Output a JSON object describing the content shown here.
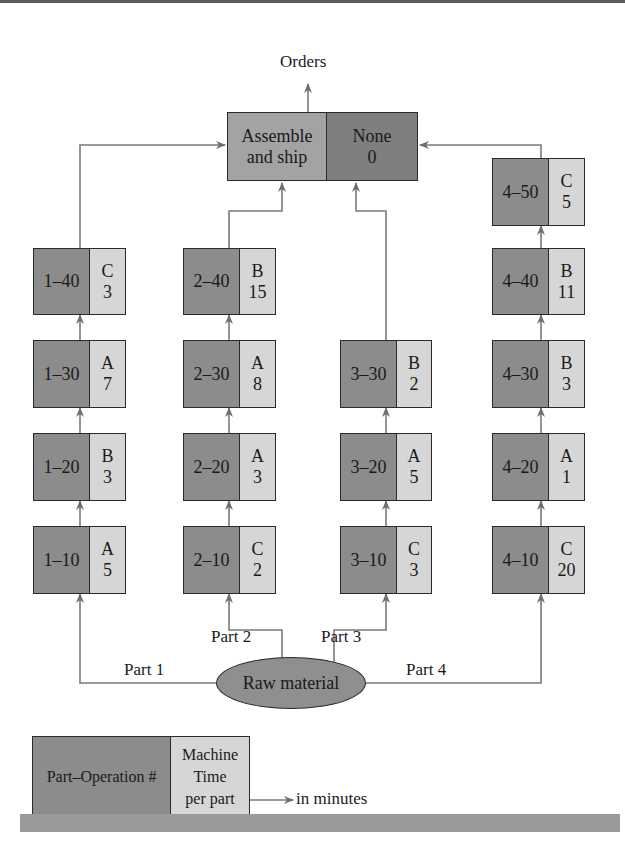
{
  "diagram": {
    "output_label": "Orders",
    "assembly": {
      "operation_line1": "Assemble",
      "operation_line2": "and ship",
      "machine": "None",
      "time": "0"
    },
    "source": {
      "label": "Raw material"
    },
    "parts": [
      {
        "label": "Part 1",
        "operations": [
          {
            "id": "1–10",
            "machine": "A",
            "time": "5"
          },
          {
            "id": "1–20",
            "machine": "B",
            "time": "3"
          },
          {
            "id": "1–30",
            "machine": "A",
            "time": "7"
          },
          {
            "id": "1–40",
            "machine": "C",
            "time": "3"
          }
        ]
      },
      {
        "label": "Part 2",
        "operations": [
          {
            "id": "2–10",
            "machine": "C",
            "time": "2"
          },
          {
            "id": "2–20",
            "machine": "A",
            "time": "3"
          },
          {
            "id": "2–30",
            "machine": "A",
            "time": "8"
          },
          {
            "id": "2–40",
            "machine": "B",
            "time": "15"
          }
        ]
      },
      {
        "label": "Part 3",
        "operations": [
          {
            "id": "3–10",
            "machine": "C",
            "time": "3"
          },
          {
            "id": "3–20",
            "machine": "A",
            "time": "5"
          },
          {
            "id": "3–30",
            "machine": "B",
            "time": "2"
          }
        ]
      },
      {
        "label": "Part 4",
        "operations": [
          {
            "id": "4–10",
            "machine": "C",
            "time": "20"
          },
          {
            "id": "4–20",
            "machine": "A",
            "time": "1"
          },
          {
            "id": "4–30",
            "machine": "B",
            "time": "3"
          },
          {
            "id": "4–40",
            "machine": "B",
            "time": "11"
          },
          {
            "id": "4–50",
            "machine": "C",
            "time": "5"
          }
        ]
      }
    ],
    "legend": {
      "operation_label": "Part–Operation #",
      "machine_label": "Machine",
      "time_line1": "Time",
      "time_line2": "per part",
      "unit_note": "in minutes"
    }
  }
}
